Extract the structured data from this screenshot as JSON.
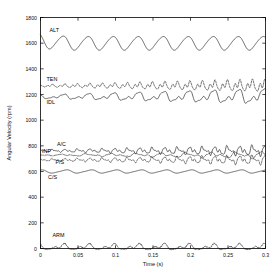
{
  "chart_data": {
    "type": "line",
    "title": "",
    "xlabel": "Time (s)",
    "ylabel": "Angular Velocity (rpm)",
    "xlim": [
      0,
      0.3
    ],
    "ylim": [
      0,
      1800
    ],
    "xticks": [
      0,
      0.05,
      0.1,
      0.15,
      0.2,
      0.25,
      0.3
    ],
    "xticklabels": [
      "0",
      "0.05",
      "0.1",
      "0.15",
      "0.2",
      "0.25",
      "0.3"
    ],
    "yticks": [
      0,
      200,
      400,
      600,
      800,
      1000,
      1200,
      1400,
      1600,
      1800
    ],
    "yticklabels": [
      "0",
      "200",
      "400",
      "600",
      "800",
      "1000",
      "1200",
      "1400",
      "1600",
      "1800"
    ],
    "grid": false,
    "legend_position": "inline-annotations",
    "series": [
      {
        "name": "ALT",
        "label": "ALT",
        "style": "solid",
        "mean": 1600,
        "amplitude": 52,
        "frequency_hz": 30,
        "label_x": 0.012,
        "label_y": 1690
      },
      {
        "name": "TEN",
        "label": "TEN",
        "style": "dashed",
        "mean": 1268,
        "amplitude": 26,
        "frequency_hz": 60,
        "label_x": 0.008,
        "label_y": 1308
      },
      {
        "name": "IDL",
        "label": "IDL",
        "style": "solid",
        "mean": 1182,
        "amplitude": 36,
        "frequency_hz": 30,
        "label_x": 0.008,
        "label_y": 1128
      },
      {
        "name": "AC",
        "label": "A/C",
        "style": "solid",
        "mean": 762,
        "amplitude": 22,
        "frequency_hz": 60,
        "label_x": 0.022,
        "label_y": 800
      },
      {
        "name": "INP",
        "label": "INP",
        "style": "dashdot",
        "mean": 728,
        "amplitude": 14,
        "frequency_hz": 30,
        "label_x": 0.002,
        "label_y": 742
      },
      {
        "name": "PS",
        "label": "P/S",
        "style": "dashed",
        "mean": 690,
        "amplitude": 20,
        "frequency_hz": 60,
        "label_x": 0.02,
        "label_y": 655
      },
      {
        "name": "CS",
        "label": "C/S",
        "style": "solid",
        "mean": 600,
        "amplitude": 12,
        "frequency_hz": 30,
        "label_x": 0.01,
        "label_y": 545
      },
      {
        "name": "ARM",
        "label": "ARM",
        "style": "dashed",
        "mean": 10,
        "amplitude": 28,
        "frequency_hz": 30,
        "label_x": 0.016,
        "label_y": 88
      }
    ]
  }
}
